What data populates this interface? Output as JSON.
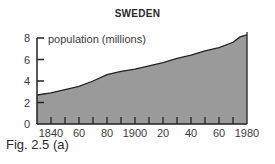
{
  "chart_data": {
    "type": "area",
    "title": "SWEDEN",
    "ylabel": "population (millions)",
    "xlabel": "",
    "ylim": [
      0,
      8
    ],
    "yticks": [
      0,
      2,
      4,
      6,
      8
    ],
    "xticks": [
      "1840",
      "60",
      "80",
      "1900",
      "20",
      "40",
      "60",
      "1980"
    ],
    "xrange": [
      1830,
      1980
    ],
    "grid": false,
    "legend": null,
    "x": [
      1830,
      1840,
      1850,
      1860,
      1870,
      1880,
      1890,
      1900,
      1910,
      1920,
      1930,
      1940,
      1950,
      1960,
      1970,
      1975,
      1980
    ],
    "values": [
      2.7,
      2.9,
      3.2,
      3.5,
      4.0,
      4.6,
      4.9,
      5.1,
      5.4,
      5.7,
      6.1,
      6.4,
      6.8,
      7.1,
      7.6,
      8.1,
      8.3
    ],
    "fill_color": "#9a9a9a",
    "line_color": "#222222"
  },
  "caption": "Fig. 2.5 (a)"
}
